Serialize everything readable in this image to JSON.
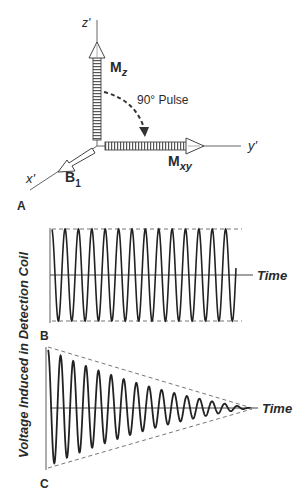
{
  "panel_a": {
    "label": "A",
    "axis_z": "z'",
    "axis_y": "y'",
    "axis_x": "x'",
    "vector_mz": {
      "main": "M",
      "sub": "z"
    },
    "vector_mxy": {
      "main": "M",
      "sub": "xy"
    },
    "vector_b1": {
      "main": "B",
      "sub": "1"
    },
    "pulse_label": "90° Pulse"
  },
  "panel_b": {
    "label": "B",
    "x_axis_label": "Time",
    "cycles": 13,
    "envelope": "constant"
  },
  "panel_c": {
    "label": "C",
    "x_axis_label": "Time",
    "cycles": 16,
    "envelope": "exponential-decay"
  },
  "y_axis_label": "Voltage Induced in Detection Coil",
  "colors": {
    "ink": "#2a2a2a",
    "axis": "#555555",
    "dash": "#666666",
    "background": "#ffffff"
  }
}
